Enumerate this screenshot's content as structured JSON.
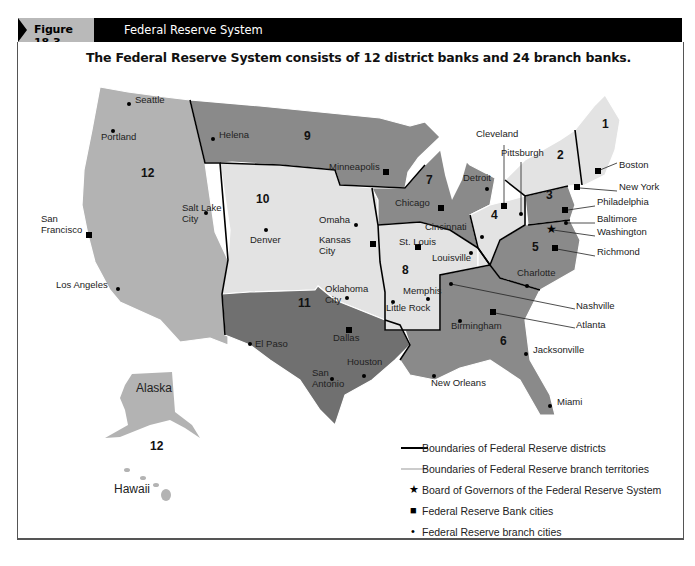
{
  "header": {
    "figure_number": "Figure 18.3",
    "figure_title": "Federal Reserve System"
  },
  "subtitle": "The Federal Reserve System consists of 12 district banks and 24 branch banks.",
  "colors": {
    "header_bg": "#000000",
    "tab_bg": "#b9b9b9",
    "district_light": "#e3e3e3",
    "district_mid": "#b3b3b3",
    "district_dark": "#8a8a8a",
    "district_darker": "#707070"
  },
  "map": {
    "district_numbers": [
      {
        "label": "1",
        "x": 602,
        "y": 124
      },
      {
        "label": "2",
        "x": 557,
        "y": 155
      },
      {
        "label": "3",
        "x": 546,
        "y": 195
      },
      {
        "label": "4",
        "x": 491,
        "y": 215
      },
      {
        "label": "5",
        "x": 532,
        "y": 247
      },
      {
        "label": "6",
        "x": 500,
        "y": 341
      },
      {
        "label": "7",
        "x": 426,
        "y": 180
      },
      {
        "label": "8",
        "x": 402,
        "y": 270
      },
      {
        "label": "9",
        "x": 304,
        "y": 136
      },
      {
        "label": "10",
        "x": 256,
        "y": 199
      },
      {
        "label": "11",
        "x": 298,
        "y": 303
      },
      {
        "label": "12",
        "x": 141,
        "y": 173
      },
      {
        "label": "12",
        "x": 150,
        "y": 446
      }
    ],
    "bank_cities": [
      {
        "name": "Boston",
        "x": 598,
        "y": 171,
        "lx": 619,
        "ly": 164
      },
      {
        "name": "New York",
        "x": 577,
        "y": 187,
        "lx": 619,
        "ly": 186
      },
      {
        "name": "Philadelphia",
        "x": 565,
        "y": 210,
        "lx": 597,
        "ly": 201
      },
      {
        "name": "Cleveland",
        "x": 504,
        "y": 206,
        "lx": 476,
        "ly": 133
      },
      {
        "name": "Richmond",
        "x": 555,
        "y": 248,
        "lx": 597,
        "ly": 251
      },
      {
        "name": "Atlanta",
        "x": 493,
        "y": 312,
        "lx": 576,
        "ly": 324
      },
      {
        "name": "Chicago",
        "x": 441,
        "y": 208,
        "lx": 395,
        "ly": 202
      },
      {
        "name": "St. Louis",
        "x": 418,
        "y": 247,
        "lx": 399,
        "ly": 241
      },
      {
        "name": "Minneapolis",
        "x": 386,
        "y": 172,
        "lx": 329,
        "ly": 166
      },
      {
        "name": "Kansas City",
        "x": 373,
        "y": 244,
        "lx": 319,
        "ly": 239
      },
      {
        "name": "Dallas",
        "x": 349,
        "y": 330,
        "lx": 333,
        "ly": 337
      },
      {
        "name": "San Francisco",
        "x": 89,
        "y": 235,
        "lx": 41,
        "ly": 218
      }
    ],
    "branch_cities": [
      {
        "name": "Seattle",
        "x": 129,
        "y": 104,
        "lx": 135,
        "ly": 99
      },
      {
        "name": "Portland",
        "x": 113,
        "y": 131,
        "lx": 101,
        "ly": 136
      },
      {
        "name": "Helena",
        "x": 213,
        "y": 139,
        "lx": 219,
        "ly": 134
      },
      {
        "name": "Salt Lake City",
        "x": 206,
        "y": 213,
        "lx": 182,
        "ly": 207
      },
      {
        "name": "Los Angeles",
        "x": 118,
        "y": 289,
        "lx": 56,
        "ly": 284
      },
      {
        "name": "Denver",
        "x": 266,
        "y": 230,
        "lx": 250,
        "ly": 239
      },
      {
        "name": "Omaha",
        "x": 356,
        "y": 225,
        "lx": 319,
        "ly": 219
      },
      {
        "name": "Oklahoma City",
        "x": 347,
        "y": 298,
        "lx": 325,
        "ly": 288
      },
      {
        "name": "El Paso",
        "x": 250,
        "y": 344,
        "lx": 255,
        "ly": 343
      },
      {
        "name": "San Antonio",
        "x": 332,
        "y": 379,
        "lx": 312,
        "ly": 372
      },
      {
        "name": "Houston",
        "x": 364,
        "y": 376,
        "lx": 347,
        "ly": 361
      },
      {
        "name": "Little Rock",
        "x": 393,
        "y": 302,
        "lx": 386,
        "ly": 307
      },
      {
        "name": "Memphis",
        "x": 428,
        "y": 299,
        "lx": 403,
        "ly": 290
      },
      {
        "name": "Louisville",
        "x": 471,
        "y": 253,
        "lx": 432,
        "ly": 257
      },
      {
        "name": "Cincinnati",
        "x": 482,
        "y": 237,
        "lx": 425,
        "ly": 226
      },
      {
        "name": "Detroit",
        "x": 487,
        "y": 189,
        "lx": 463,
        "ly": 177
      },
      {
        "name": "Pittsburgh",
        "x": 521,
        "y": 214,
        "lx": 501,
        "ly": 152
      },
      {
        "name": "Baltimore",
        "x": 566,
        "y": 223,
        "lx": 597,
        "ly": 218
      },
      {
        "name": "Charlotte",
        "x": 527,
        "y": 286,
        "lx": 517,
        "ly": 272
      },
      {
        "name": "Nashville",
        "x": 451,
        "y": 284,
        "lx": 576,
        "ly": 305
      },
      {
        "name": "Birmingham",
        "x": 460,
        "y": 321,
        "lx": 451,
        "ly": 325
      },
      {
        "name": "Jacksonville",
        "x": 526,
        "y": 354,
        "lx": 533,
        "ly": 349
      },
      {
        "name": "New Orleans",
        "x": 434,
        "y": 376,
        "lx": 431,
        "ly": 382
      },
      {
        "name": "Miami",
        "x": 550,
        "y": 406,
        "lx": 557,
        "ly": 401
      }
    ],
    "board_of_governors": {
      "name": "Washington",
      "x": 551,
      "y": 229,
      "lx": 597,
      "ly": 231
    },
    "region_labels": [
      {
        "name": "Alaska",
        "x": 136,
        "y": 389
      },
      {
        "name": "Hawaii",
        "x": 114,
        "y": 490
      }
    ]
  },
  "legend": {
    "items": [
      {
        "symbol": "thick-line",
        "label": "Boundaries of Federal Reserve districts"
      },
      {
        "symbol": "thin-line",
        "label": "Boundaries of Federal Reserve branch territories"
      },
      {
        "symbol": "★",
        "label": "Board of Governors of the Federal Reserve System"
      },
      {
        "symbol": "■",
        "label": "Federal Reserve Bank cities"
      },
      {
        "symbol": "•",
        "label": "Federal Reserve branch cities"
      }
    ]
  }
}
